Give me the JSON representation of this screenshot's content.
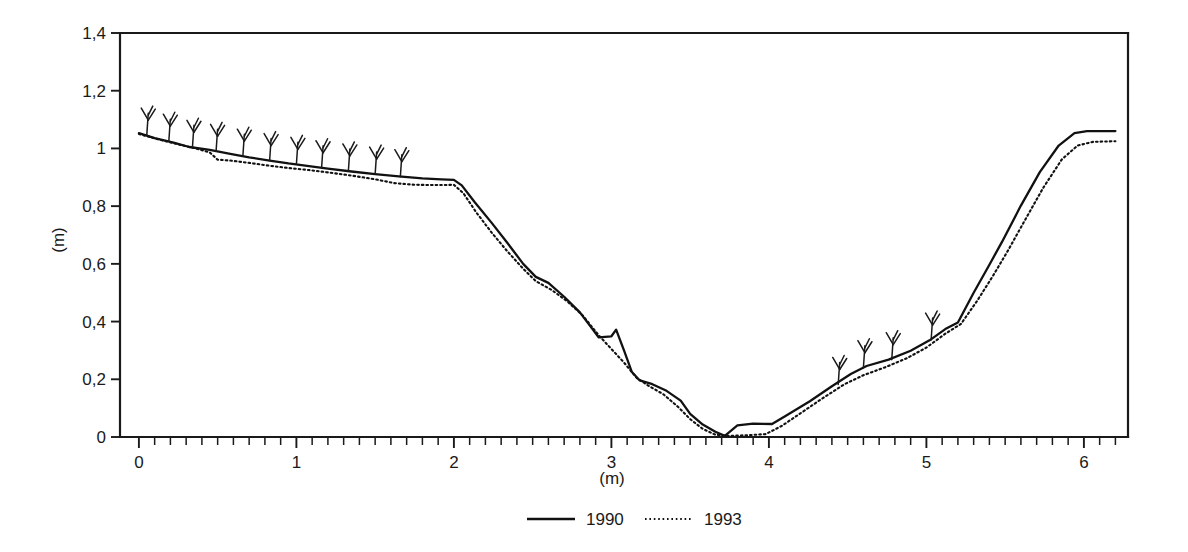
{
  "chart_data": {
    "type": "line",
    "title": "",
    "xlabel": "(m)",
    "ylabel": "(m)",
    "xlim": [
      -0.12,
      6.28
    ],
    "ylim": [
      0,
      1.4
    ],
    "grid": false,
    "legend_position": "bottom-center",
    "x_ticks_major": [
      0,
      1,
      2,
      3,
      4,
      5,
      6
    ],
    "x_tick_labels": [
      "0",
      "1",
      "2",
      "3",
      "4",
      "5",
      "6"
    ],
    "x_tick_minor_step": 0.1,
    "y_ticks_major": [
      0,
      0.2,
      0.4,
      0.6,
      0.8,
      1,
      1.2,
      1.4
    ],
    "y_tick_labels": [
      "0",
      "0,2",
      "0,4",
      "0,6",
      "0,8",
      "1",
      "1,2",
      "1,4"
    ],
    "series": [
      {
        "name": "1990",
        "style": "solid",
        "color": "#111111",
        "points": [
          [
            0.0,
            1.053
          ],
          [
            0.1,
            1.036
          ],
          [
            0.22,
            1.02
          ],
          [
            0.32,
            1.005
          ],
          [
            0.45,
            0.995
          ],
          [
            0.58,
            0.981
          ],
          [
            0.7,
            0.969
          ],
          [
            0.83,
            0.958
          ],
          [
            0.95,
            0.948
          ],
          [
            1.08,
            0.939
          ],
          [
            1.2,
            0.93
          ],
          [
            1.35,
            0.92
          ],
          [
            1.5,
            0.911
          ],
          [
            1.65,
            0.903
          ],
          [
            1.8,
            0.896
          ],
          [
            1.92,
            0.893
          ],
          [
            2.0,
            0.891
          ],
          [
            2.05,
            0.872
          ],
          [
            2.13,
            0.815
          ],
          [
            2.24,
            0.742
          ],
          [
            2.34,
            0.672
          ],
          [
            2.44,
            0.6
          ],
          [
            2.52,
            0.555
          ],
          [
            2.6,
            0.534
          ],
          [
            2.7,
            0.486
          ],
          [
            2.8,
            0.432
          ],
          [
            2.88,
            0.374
          ],
          [
            2.92,
            0.345
          ],
          [
            3.0,
            0.349
          ],
          [
            3.03,
            0.372
          ],
          [
            3.08,
            0.3
          ],
          [
            3.13,
            0.225
          ],
          [
            3.18,
            0.196
          ],
          [
            3.26,
            0.183
          ],
          [
            3.35,
            0.16
          ],
          [
            3.44,
            0.126
          ],
          [
            3.5,
            0.08
          ],
          [
            3.58,
            0.043
          ],
          [
            3.66,
            0.018
          ],
          [
            3.72,
            0.004
          ],
          [
            3.8,
            0.04
          ],
          [
            3.9,
            0.046
          ],
          [
            4.02,
            0.045
          ],
          [
            4.1,
            0.071
          ],
          [
            4.26,
            0.124
          ],
          [
            4.4,
            0.176
          ],
          [
            4.52,
            0.218
          ],
          [
            4.62,
            0.246
          ],
          [
            4.76,
            0.268
          ],
          [
            4.9,
            0.299
          ],
          [
            5.02,
            0.335
          ],
          [
            5.12,
            0.374
          ],
          [
            5.2,
            0.397
          ],
          [
            5.3,
            0.5
          ],
          [
            5.4,
            0.597
          ],
          [
            5.48,
            0.676
          ],
          [
            5.6,
            0.802
          ],
          [
            5.72,
            0.918
          ],
          [
            5.84,
            1.01
          ],
          [
            5.94,
            1.053
          ],
          [
            6.02,
            1.06
          ],
          [
            6.2,
            1.06
          ]
        ]
      },
      {
        "name": "1993",
        "style": "dotted",
        "color": "#111111",
        "points": [
          [
            0.0,
            1.05
          ],
          [
            0.12,
            1.032
          ],
          [
            0.25,
            1.014
          ],
          [
            0.36,
            1.0
          ],
          [
            0.45,
            0.986
          ],
          [
            0.5,
            0.961
          ],
          [
            0.58,
            0.958
          ],
          [
            0.7,
            0.95
          ],
          [
            0.83,
            0.94
          ],
          [
            0.95,
            0.932
          ],
          [
            1.08,
            0.925
          ],
          [
            1.2,
            0.917
          ],
          [
            1.35,
            0.906
          ],
          [
            1.5,
            0.893
          ],
          [
            1.62,
            0.88
          ],
          [
            1.75,
            0.874
          ],
          [
            1.9,
            0.873
          ],
          [
            2.0,
            0.874
          ],
          [
            2.06,
            0.845
          ],
          [
            2.14,
            0.78
          ],
          [
            2.24,
            0.708
          ],
          [
            2.34,
            0.643
          ],
          [
            2.44,
            0.583
          ],
          [
            2.52,
            0.54
          ],
          [
            2.62,
            0.51
          ],
          [
            2.72,
            0.47
          ],
          [
            2.82,
            0.42
          ],
          [
            2.92,
            0.352
          ],
          [
            3.0,
            0.305
          ],
          [
            3.08,
            0.258
          ],
          [
            3.16,
            0.205
          ],
          [
            3.24,
            0.176
          ],
          [
            3.33,
            0.148
          ],
          [
            3.42,
            0.106
          ],
          [
            3.5,
            0.062
          ],
          [
            3.58,
            0.028
          ],
          [
            3.66,
            0.008
          ],
          [
            3.74,
            0.004
          ],
          [
            3.86,
            0.006
          ],
          [
            3.98,
            0.01
          ],
          [
            4.08,
            0.038
          ],
          [
            4.2,
            0.082
          ],
          [
            4.34,
            0.134
          ],
          [
            4.48,
            0.183
          ],
          [
            4.6,
            0.214
          ],
          [
            4.74,
            0.242
          ],
          [
            4.88,
            0.274
          ],
          [
            5.0,
            0.31
          ],
          [
            5.12,
            0.358
          ],
          [
            5.22,
            0.392
          ],
          [
            5.32,
            0.47
          ],
          [
            5.42,
            0.556
          ],
          [
            5.52,
            0.648
          ],
          [
            5.62,
            0.746
          ],
          [
            5.74,
            0.862
          ],
          [
            5.86,
            0.962
          ],
          [
            5.96,
            1.01
          ],
          [
            6.06,
            1.023
          ],
          [
            6.2,
            1.025
          ]
        ]
      }
    ],
    "vegetation_marks": [
      {
        "x": 0.05,
        "y": 1.046
      },
      {
        "x": 0.19,
        "y": 1.025
      },
      {
        "x": 0.34,
        "y": 1.004
      },
      {
        "x": 0.49,
        "y": 0.99
      },
      {
        "x": 0.66,
        "y": 0.973
      },
      {
        "x": 0.83,
        "y": 0.958
      },
      {
        "x": 1.0,
        "y": 0.945
      },
      {
        "x": 1.16,
        "y": 0.933
      },
      {
        "x": 1.33,
        "y": 0.922
      },
      {
        "x": 1.5,
        "y": 0.911
      },
      {
        "x": 1.66,
        "y": 0.902
      },
      {
        "x": 4.44,
        "y": 0.182
      },
      {
        "x": 4.6,
        "y": 0.24
      },
      {
        "x": 4.78,
        "y": 0.268
      },
      {
        "x": 5.03,
        "y": 0.336
      }
    ]
  },
  "legend": {
    "entries": [
      {
        "label": "1990",
        "style": "solid"
      },
      {
        "label": "1993",
        "style": "dotted"
      }
    ]
  }
}
